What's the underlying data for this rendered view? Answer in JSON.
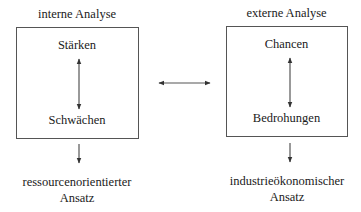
{
  "diagram": {
    "type": "SWOT analysis flow",
    "left": {
      "title": "interne Analyse",
      "top": "Stärken",
      "bottom": "Schwächen",
      "result_line1": "ressourcenorientierter",
      "result_line2": "Ansatz"
    },
    "right": {
      "title": "externe Analyse",
      "top": "Chancen",
      "bottom": "Bedrohungen",
      "result_line1": "industrieökonomischer",
      "result_line2": "Ansatz"
    },
    "connector": "bidirectional arrow between internal and external analysis",
    "colors": {
      "line": "#555555",
      "text": "#1a1a1a",
      "background": "#ffffff"
    }
  }
}
